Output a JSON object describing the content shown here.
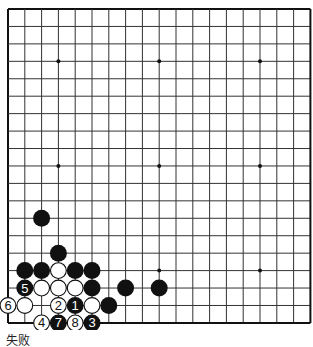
{
  "board": {
    "size": 19,
    "origin_x": 8,
    "origin_y": 9,
    "spacing_x": 16.8,
    "spacing_y": 17.44,
    "stone_diameter": 17,
    "line_color": "#333333",
    "border_color": "#111111",
    "background": "#ffffff",
    "star_points": [
      [
        3,
        3
      ],
      [
        9,
        3
      ],
      [
        15,
        3
      ],
      [
        3,
        9
      ],
      [
        9,
        9
      ],
      [
        15,
        9
      ],
      [
        3,
        15
      ],
      [
        9,
        15
      ],
      [
        15,
        15
      ]
    ],
    "stones": [
      {
        "col": 2,
        "row": 12,
        "color": "black",
        "label": ""
      },
      {
        "col": 3,
        "row": 14,
        "color": "black",
        "label": ""
      },
      {
        "col": 1,
        "row": 15,
        "color": "black",
        "label": ""
      },
      {
        "col": 2,
        "row": 15,
        "color": "black",
        "label": ""
      },
      {
        "col": 3,
        "row": 15,
        "color": "white",
        "label": ""
      },
      {
        "col": 4,
        "row": 15,
        "color": "black",
        "label": ""
      },
      {
        "col": 5,
        "row": 15,
        "color": "black",
        "label": ""
      },
      {
        "col": 1,
        "row": 16,
        "color": "black",
        "label": "5"
      },
      {
        "col": 2,
        "row": 16,
        "color": "white",
        "label": ""
      },
      {
        "col": 3,
        "row": 16,
        "color": "white",
        "label": ""
      },
      {
        "col": 4,
        "row": 16,
        "color": "white",
        "label": ""
      },
      {
        "col": 5,
        "row": 16,
        "color": "black",
        "label": ""
      },
      {
        "col": 7,
        "row": 16,
        "color": "black",
        "label": ""
      },
      {
        "col": 9,
        "row": 16,
        "color": "black",
        "label": ""
      },
      {
        "col": 0,
        "row": 17,
        "color": "white",
        "label": "6"
      },
      {
        "col": 1,
        "row": 17,
        "color": "white",
        "label": ""
      },
      {
        "col": 3,
        "row": 17,
        "color": "white",
        "label": "2"
      },
      {
        "col": 4,
        "row": 17,
        "color": "black",
        "label": "1"
      },
      {
        "col": 5,
        "row": 17,
        "color": "white",
        "label": ""
      },
      {
        "col": 6,
        "row": 17,
        "color": "black",
        "label": ""
      },
      {
        "col": 2,
        "row": 18,
        "color": "white",
        "label": "4"
      },
      {
        "col": 3,
        "row": 18,
        "color": "black",
        "label": "7"
      },
      {
        "col": 4,
        "row": 18,
        "color": "white",
        "label": "8"
      },
      {
        "col": 5,
        "row": 18,
        "color": "black",
        "label": "3"
      }
    ]
  },
  "caption": "失败"
}
